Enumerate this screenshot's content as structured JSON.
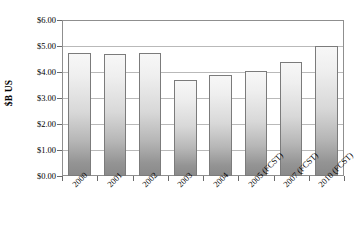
{
  "chart_data": {
    "type": "bar",
    "title": "",
    "subtitle": "",
    "xlabel": "",
    "ylabel": "$B US",
    "categories": [
      "2000",
      "2001",
      "2002",
      "2003",
      "2004",
      "2005 (FCST)",
      "2007 (FCST)",
      "2010 (FCST)"
    ],
    "values": [
      4.75,
      4.7,
      4.73,
      3.7,
      3.9,
      4.05,
      4.4,
      5.0
    ],
    "ylim": [
      0.0,
      6.0
    ],
    "ytick_step": 1.0,
    "ytick_labels": [
      "$0.00",
      "$1.00",
      "$2.00",
      "$3.00",
      "$4.00",
      "$5.00",
      "$6.00"
    ],
    "ytick_values": [
      0.0,
      1.0,
      2.0,
      3.0,
      4.0,
      5.0,
      6.0
    ],
    "grid": true,
    "grid_axis": "y",
    "legend": false,
    "legend_position": "none",
    "bar_fill_top_color": "#f7f7f7",
    "bar_fill_bottom_color": "#8a8a8a",
    "bar_border_color": "#7b7b7b",
    "grid_color": "#b9b9b9",
    "axis_color": "#8f8f8f",
    "background_color": "#ffffff",
    "xtick_label_rotation": -45
  }
}
